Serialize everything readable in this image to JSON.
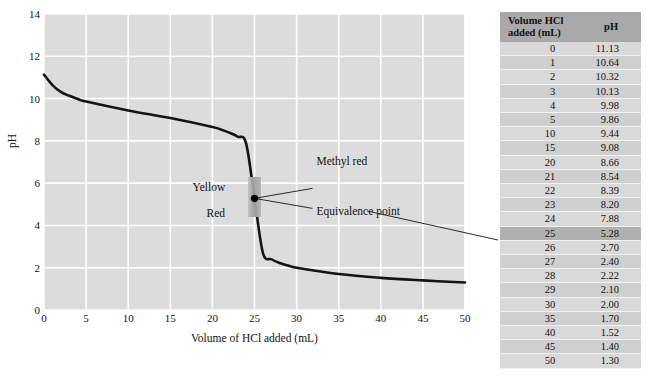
{
  "chart_data": {
    "type": "line",
    "title": "",
    "xlabel": "Volume of HCl added (mL)",
    "ylabel": "pH",
    "xlim": [
      0,
      50
    ],
    "ylim": [
      0,
      14
    ],
    "xticks": [
      0,
      5,
      10,
      15,
      20,
      25,
      30,
      35,
      40,
      45,
      50
    ],
    "yticks": [
      0,
      2,
      4,
      6,
      8,
      10,
      12,
      14
    ],
    "grid": true,
    "legend": "none",
    "series": [
      {
        "name": "Titration curve",
        "x": [
          0,
          1,
          2,
          3,
          4,
          5,
          10,
          15,
          20,
          21,
          22,
          23,
          24,
          25,
          26,
          27,
          28,
          29,
          30,
          35,
          40,
          45,
          50
        ],
        "y": [
          11.13,
          10.64,
          10.32,
          10.13,
          9.98,
          9.86,
          9.44,
          9.08,
          8.66,
          8.54,
          8.39,
          8.2,
          7.88,
          5.28,
          2.7,
          2.4,
          2.22,
          2.1,
          2.0,
          1.7,
          1.52,
          1.4,
          1.3
        ]
      }
    ],
    "annotations": [
      {
        "name": "equivalence-point-marker",
        "x": 25,
        "y": 5.28,
        "label": "Equivalence point"
      },
      {
        "name": "methyl-red-indicator-band",
        "x": 25,
        "y_low": 4.4,
        "y_high": 6.3,
        "label": "Methyl red"
      },
      {
        "name": "indicator-color-basic",
        "label": "Yellow"
      },
      {
        "name": "indicator-color-acidic",
        "label": "Red"
      }
    ]
  },
  "chart": {
    "x_axis_title": "Volume of HCl added (mL)",
    "y_axis_title": "pH",
    "xticks": [
      "0",
      "5",
      "10",
      "15",
      "20",
      "25",
      "30",
      "35",
      "40",
      "45",
      "50"
    ],
    "yticks": [
      "0",
      "2",
      "4",
      "6",
      "8",
      "10",
      "12",
      "14"
    ],
    "annotations": {
      "methyl_red": "Methyl red",
      "equivalence_point": "Equivalence point",
      "yellow": "Yellow",
      "red": "Red"
    },
    "colors": {
      "plot_background": "#dcdcdc",
      "gridline": "#ffffff",
      "curve": "#141414",
      "indicator_band": "#9e9e9e",
      "marker": "#000000"
    }
  },
  "table": {
    "headers": [
      "Volume HCl added (mL)",
      "pH"
    ],
    "header_line1": "Volume HCl",
    "header_line2": "added (mL)",
    "header_ph": "pH",
    "highlight_row_index": 13,
    "rows": [
      {
        "volume": "0",
        "ph": "11.13"
      },
      {
        "volume": "1",
        "ph": "10.64"
      },
      {
        "volume": "2",
        "ph": "10.32"
      },
      {
        "volume": "3",
        "ph": "10.13"
      },
      {
        "volume": "4",
        "ph": "9.98"
      },
      {
        "volume": "5",
        "ph": "9.86"
      },
      {
        "volume": "10",
        "ph": "9.44"
      },
      {
        "volume": "15",
        "ph": "9.08"
      },
      {
        "volume": "20",
        "ph": "8.66"
      },
      {
        "volume": "21",
        "ph": "8.54"
      },
      {
        "volume": "22",
        "ph": "8.39"
      },
      {
        "volume": "23",
        "ph": "8.20"
      },
      {
        "volume": "24",
        "ph": "7.88"
      },
      {
        "volume": "25",
        "ph": "5.28"
      },
      {
        "volume": "26",
        "ph": "2.70"
      },
      {
        "volume": "27",
        "ph": "2.40"
      },
      {
        "volume": "28",
        "ph": "2.22"
      },
      {
        "volume": "29",
        "ph": "2.10"
      },
      {
        "volume": "30",
        "ph": "2.00"
      },
      {
        "volume": "35",
        "ph": "1.70"
      },
      {
        "volume": "40",
        "ph": "1.52"
      },
      {
        "volume": "45",
        "ph": "1.40"
      },
      {
        "volume": "50",
        "ph": "1.30"
      }
    ]
  }
}
